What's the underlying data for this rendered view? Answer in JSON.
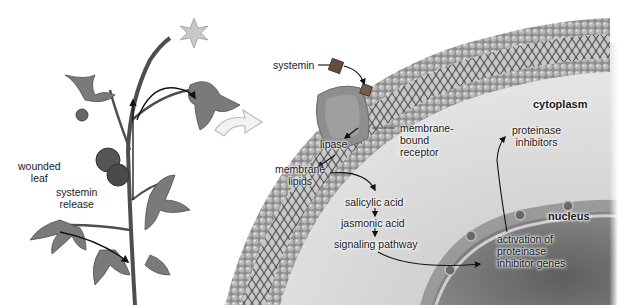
{
  "diagram": {
    "labels": {
      "wounded_leaf": "wounded\nleaf",
      "wounded_leaf_line1": "wounded",
      "wounded_leaf_line2": "leaf",
      "systemin_release_line1": "systemin",
      "systemin_release_line2": "release",
      "systemin": "systemin",
      "lipase": "lipase",
      "membrane_lipids_line1": "membrane",
      "membrane_lipids_line2": "lipids",
      "membrane_bound_receptor_line1": "membrane-",
      "membrane_bound_receptor_line2": "bound",
      "membrane_bound_receptor_line3": "receptor",
      "cytoplasm": "cytoplasm",
      "proteinase_inhibitors_line1": "proteinase",
      "proteinase_inhibitors_line2": "inhibitors",
      "salicylic_acid": "salicylic acid",
      "jasmonic_acid": "jasmonic acid",
      "signaling_pathway": "signaling pathway",
      "nucleus": "nucleus",
      "activation_line1": "activation of",
      "activation_line2": "proteinase",
      "activation_line3": "inhibitor genes"
    },
    "pathway_steps": [
      "systemin release",
      "systemin",
      "membrane-bound receptor",
      "lipase",
      "membrane lipids",
      "salicylic acid",
      "jasmonic acid",
      "signaling pathway",
      "activation of proteinase inhibitor genes",
      "proteinase inhibitors"
    ],
    "colors": {
      "background": "#ffffff",
      "membrane_head": "#a8a8a8",
      "membrane_tail": "#5a5a5a",
      "cytoplasm": "#d9d9d9",
      "nucleus": "#7a7a7a",
      "plant": "#6b6b6b",
      "arrow": "#111111"
    }
  }
}
